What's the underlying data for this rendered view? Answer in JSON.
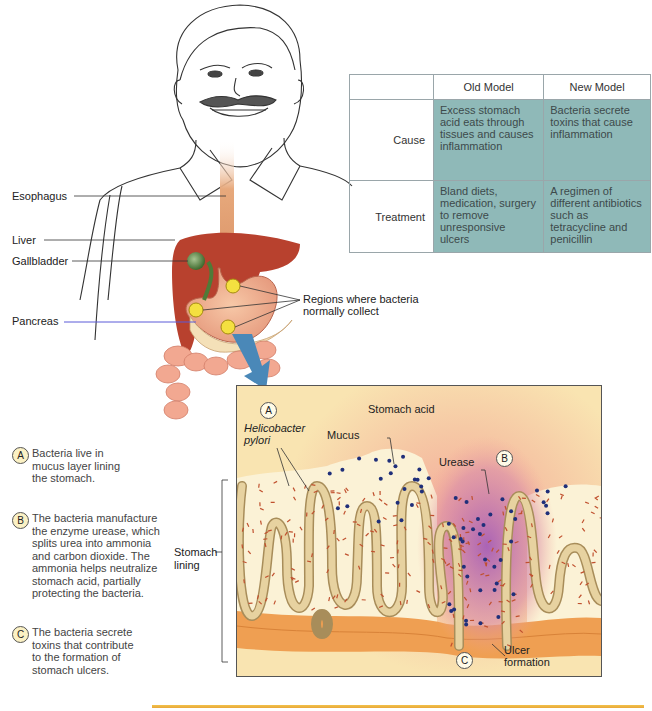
{
  "figure": {
    "labels": {
      "esophagus": "Esophagus",
      "liver": "Liver",
      "gallbladder": "Gallbladder",
      "pancreas": "Pancreas",
      "regions": [
        "Regions where bacteria",
        "normally collect"
      ]
    },
    "table": {
      "headers": [
        "",
        "Old Model",
        "New Model"
      ],
      "rows": [
        {
          "label": "Cause",
          "old": "Excess stomach acid eats through tissues and causes inflammation",
          "new": "Bacteria secrete toxins that cause inflammation"
        },
        {
          "label": "Treatment",
          "old": "Bland diets, medication, surgery to remove unresponsive ulcers",
          "new": "A regimen of different antibiotics such as tetracycline and penicillin"
        }
      ]
    },
    "notes": [
      {
        "marker": "A",
        "text": "Bacteria live in mucus layer lining the stomach."
      },
      {
        "marker": "B",
        "text": "The bacteria manufacture the enzyme urease, which splits urea into ammonia and carbon dioxide. The ammonia helps neutralize stomach acid, partially protecting the bacteria."
      },
      {
        "marker": "C",
        "text": "The bacteria secrete toxins that contribute to the formation of stomach ulcers."
      }
    ],
    "panel": {
      "marker_a": "A",
      "marker_b": "B",
      "marker_c": "C",
      "stomach_acid": "Stomach acid",
      "helicobacter": [
        "Helicobacter",
        "pylori"
      ],
      "mucus": "Mucus",
      "urease": "Urease",
      "ulcer": [
        "Ulcer",
        "formation"
      ],
      "stomach_lining": [
        "Stomach",
        "lining"
      ]
    },
    "colors": {
      "table_cell": "#8fb9b8",
      "liver": "#b8412e",
      "gallbladder": "#4f7b38",
      "bacteria_region": "#f4e040",
      "arrow": "#4a88b8",
      "urease_dot": "#1f2f7a",
      "bacteria": "#c0502e",
      "rule": "#eab43e"
    }
  }
}
